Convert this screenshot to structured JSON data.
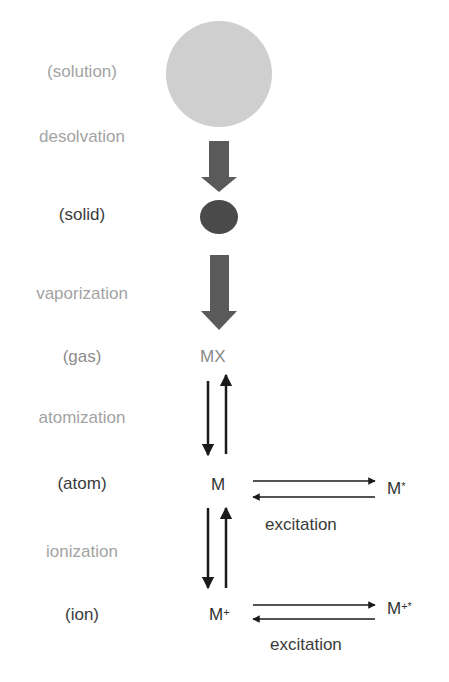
{
  "diagram": {
    "states": [
      {
        "id": "solution",
        "label": "(solution)",
        "tone": "light"
      },
      {
        "id": "solid",
        "label": "(solid)",
        "tone": "dark"
      },
      {
        "id": "gas",
        "label": "(gas)",
        "tone": "mid"
      },
      {
        "id": "atom",
        "label": "(atom)",
        "tone": "dark"
      },
      {
        "id": "ion",
        "label": "(ion)",
        "tone": "dark"
      }
    ],
    "processes": [
      {
        "id": "desolvation",
        "label": "desolvation",
        "tone": "light"
      },
      {
        "id": "vaporization",
        "label": "vaporization",
        "tone": "light"
      },
      {
        "id": "atomization",
        "label": "atomization",
        "tone": "light"
      },
      {
        "id": "ionization",
        "label": "ionization",
        "tone": "light"
      }
    ],
    "species": {
      "gas": "MX",
      "atom": "M",
      "ion_base": "M",
      "ion_sup": "+",
      "atom_excited_base": "M",
      "atom_excited_sup": "*",
      "ion_excited_base": "M",
      "ion_excited_sup": "+*"
    },
    "excitation": {
      "atom_label": "excitation",
      "ion_label": "excitation"
    },
    "colors": {
      "solution_circle": "#cfcfcf",
      "solid_ellipse": "#4a4a4a",
      "block_arrow": "#5a5a5a",
      "line_arrow": "#1a1a1a"
    }
  }
}
